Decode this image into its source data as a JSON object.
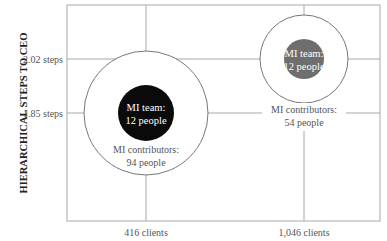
{
  "chart_data": {
    "type": "bubble",
    "title": "",
    "xlabel": "",
    "ylabel": "HIERARCHICAL STEPS TO CEO",
    "grid": true,
    "x_ticks": [
      {
        "value": 416,
        "label": "416 clients"
      },
      {
        "value": 1046,
        "label": "1,046 clients"
      }
    ],
    "y_ticks": [
      {
        "value": 2.02,
        "label": "2.02 steps"
      },
      {
        "value": 1.85,
        "label": "1.85 steps"
      }
    ],
    "points": [
      {
        "x": 416,
        "y": 1.85,
        "inner": {
          "label_line1": "MI team:",
          "label_line2": "12 people",
          "people": 12,
          "color": "#0a0a0a"
        },
        "outer": {
          "label_line1": "MI contributors:",
          "label_line2": "94 people",
          "people": 94
        }
      },
      {
        "x": 1046,
        "y": 2.02,
        "inner": {
          "label_line1": "MI team:",
          "label_line2": "12 people",
          "people": 12,
          "color": "#6e6e6e"
        },
        "outer": {
          "label_line1": "MI contributors:",
          "label_line2": "54 people",
          "people": 54
        }
      }
    ]
  }
}
